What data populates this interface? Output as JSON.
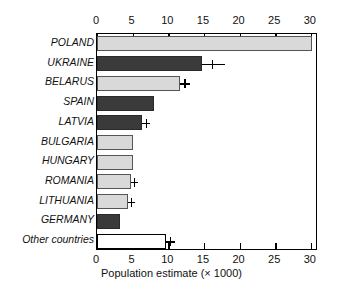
{
  "chart_data": {
    "type": "bar",
    "orientation": "horizontal",
    "title": "",
    "xlabel": "Population estimate (× 1000)",
    "ylabel": "",
    "xlim": [
      0,
      31
    ],
    "xticks": [
      0,
      5,
      10,
      15,
      20,
      25,
      30
    ],
    "xticklabels": [
      "0",
      "5",
      "10",
      "15",
      "20",
      "25",
      "30"
    ],
    "ticks_top": true,
    "ticks_bottom": true,
    "grid": false,
    "legend": null,
    "categories": [
      "POLAND",
      "UKRAINE",
      "BELARUS",
      "SPAIN",
      "LATVIA",
      "BULGARIA",
      "HUNGARY",
      "ROMANIA",
      "LITHUANIA",
      "GERMANY",
      "Other countries"
    ],
    "values": [
      30.2,
      14.7,
      11.7,
      8.0,
      6.3,
      5.0,
      5.0,
      4.8,
      4.4,
      3.2,
      9.7
    ],
    "error_high": [
      null,
      18.0,
      13.0,
      null,
      7.5,
      null,
      null,
      5.7,
      5.3,
      null,
      11.0
    ],
    "bar_styles": [
      "light",
      "dark",
      "light",
      "dark",
      "dark",
      "light",
      "light",
      "light",
      "light",
      "dark",
      "open"
    ],
    "colors": {
      "light": "#d9d9d9",
      "dark": "#3a3a3a",
      "open": "#ffffff",
      "axis": "#000000",
      "text": "#111111"
    }
  }
}
